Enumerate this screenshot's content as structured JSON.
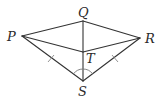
{
  "diagram": {
    "type": "geometry",
    "points": {
      "P": {
        "label": "P",
        "x": 22,
        "y": 36
      },
      "Q": {
        "label": "Q",
        "x": 83,
        "y": 21
      },
      "R": {
        "label": "R",
        "x": 140,
        "y": 38
      },
      "T": {
        "label": "T",
        "x": 83,
        "y": 52
      },
      "S": {
        "label": "S",
        "x": 83,
        "y": 81
      }
    },
    "segments": [
      "PQ",
      "QR",
      "PT",
      "TR",
      "PS",
      "RS",
      "QS"
    ],
    "congruence_marks": [
      "PS",
      "RS"
    ],
    "angle_marks": [
      "PSR bisected by ST"
    ],
    "colors": {
      "line": "#333333",
      "marks": "#888888",
      "background": "#ffffff"
    }
  }
}
